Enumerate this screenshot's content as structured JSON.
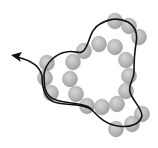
{
  "diagram": {
    "type": "bead-chain-with-closed-loop",
    "background": "#ffffff",
    "colors": {
      "bead_fill": "#b4b4b4",
      "bead_highlight": "#d6d6d6",
      "bead_edge": "#9a9a9a",
      "curve": "#111111"
    },
    "beads": [
      {
        "x": 115,
        "y": 21
      },
      {
        "x": 129,
        "y": 26
      },
      {
        "x": 139,
        "y": 37
      },
      {
        "x": 99,
        "y": 44
      },
      {
        "x": 115,
        "y": 47
      },
      {
        "x": 84,
        "y": 51
      },
      {
        "x": 126,
        "y": 60
      },
      {
        "x": 73,
        "y": 62
      },
      {
        "x": 47,
        "y": 63
      },
      {
        "x": 129,
        "y": 76
      },
      {
        "x": 70,
        "y": 79
      },
      {
        "x": 45,
        "y": 78
      },
      {
        "x": 126,
        "y": 91
      },
      {
        "x": 76,
        "y": 94
      },
      {
        "x": 51,
        "y": 93
      },
      {
        "x": 117,
        "y": 104
      },
      {
        "x": 87,
        "y": 106
      },
      {
        "x": 102,
        "y": 107
      },
      {
        "x": 142,
        "y": 114
      },
      {
        "x": 132,
        "y": 124
      },
      {
        "x": 116,
        "y": 129
      }
    ],
    "bead_radius": 7.5,
    "arrow": {
      "label": "",
      "tip": {
        "x": 12,
        "y": 55
      }
    }
  }
}
